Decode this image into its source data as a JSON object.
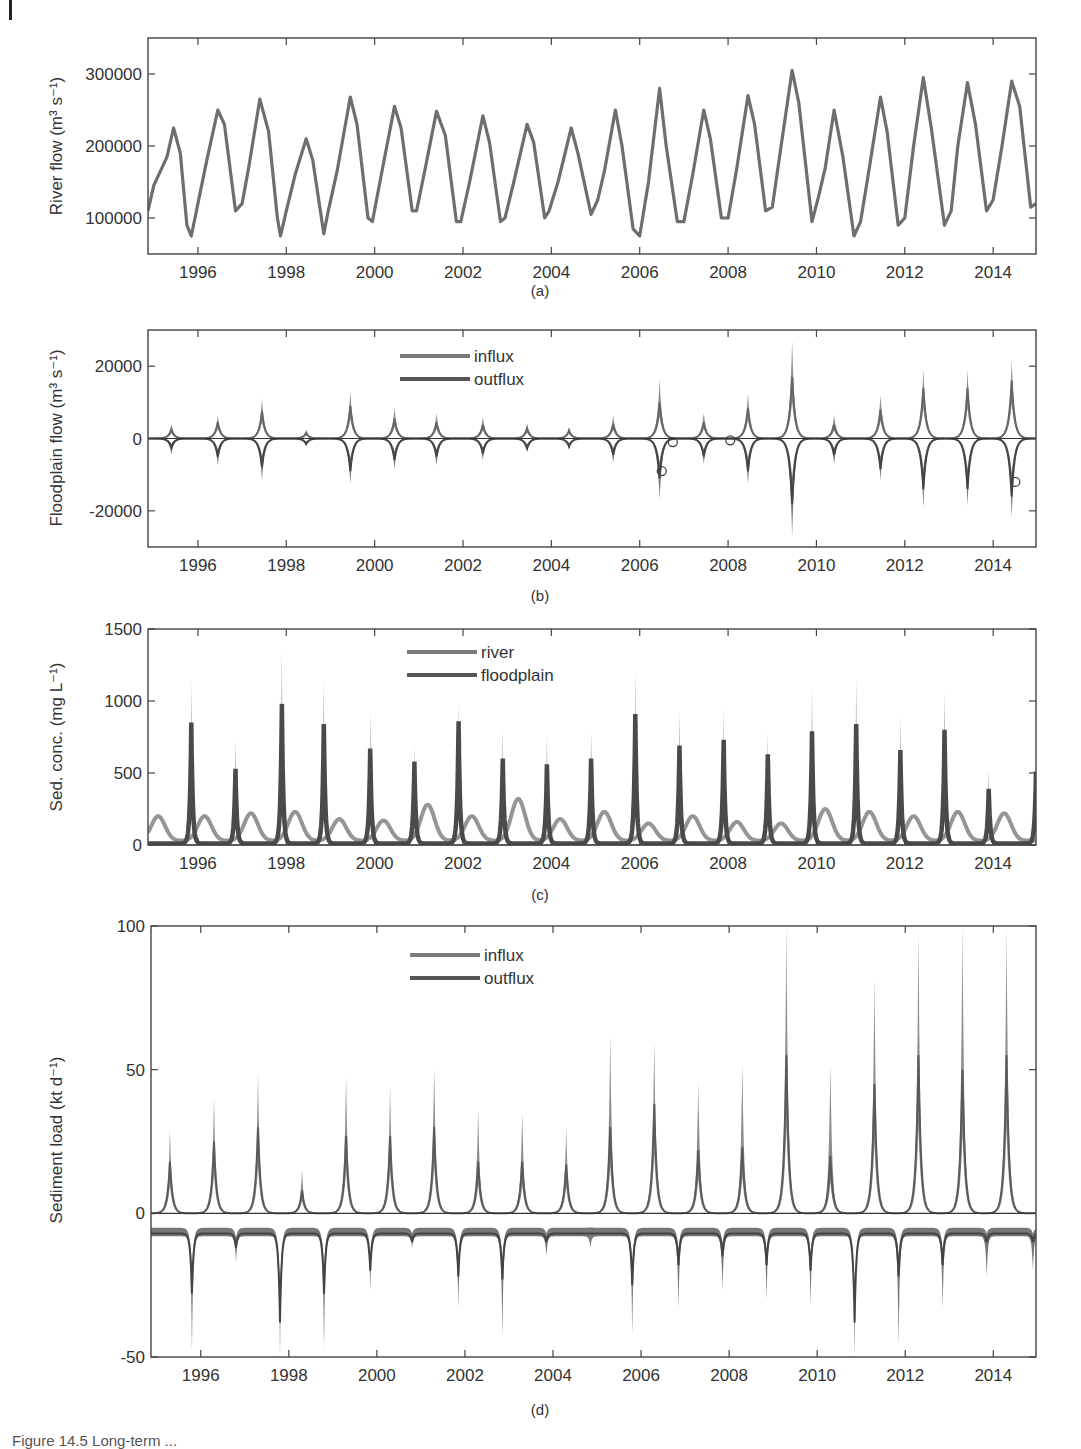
{
  "figure": {
    "caption": "Figure 14.5 Long-term ..."
  },
  "chart_data": [
    {
      "panel": "(a)",
      "type": "line",
      "title": "",
      "xlabel": "",
      "ylabel": "River flow (m³ s⁻¹)",
      "xlim": [
        1994.87,
        2014.97
      ],
      "ylim": [
        50000,
        350000
      ],
      "xticks": [
        1996,
        1998,
        2000,
        2002,
        2004,
        2006,
        2008,
        2010,
        2012,
        2014
      ],
      "yticks": [
        100000,
        200000,
        300000
      ],
      "ytick_labels": [
        "100000",
        "200000",
        "300000"
      ],
      "grid": false,
      "legend": null,
      "series": [
        {
          "name": "river flow",
          "color": "#6e6e6e",
          "x": [
            1994.87,
            1995.0,
            1995.15,
            1995.3,
            1995.45,
            1995.6,
            1995.75,
            1995.85,
            1996.0,
            1996.2,
            1996.45,
            1996.6,
            1996.85,
            1997.0,
            1997.15,
            1997.4,
            1997.6,
            1997.8,
            1997.87,
            1998.0,
            1998.2,
            1998.45,
            1998.6,
            1998.85,
            1998.95,
            1999.15,
            1999.45,
            1999.6,
            1999.85,
            1999.95,
            2000.15,
            2000.45,
            2000.6,
            2000.85,
            2000.95,
            2001.15,
            2001.4,
            2001.6,
            2001.85,
            2001.95,
            2002.15,
            2002.45,
            2002.6,
            2002.85,
            2002.95,
            2003.15,
            2003.45,
            2003.6,
            2003.85,
            2003.95,
            2004.15,
            2004.45,
            2004.6,
            2004.9,
            2005.05,
            2005.2,
            2005.45,
            2005.6,
            2005.85,
            2006.0,
            2006.2,
            2006.45,
            2006.6,
            2006.85,
            2007.0,
            2007.2,
            2007.45,
            2007.6,
            2007.85,
            2008.0,
            2008.2,
            2008.45,
            2008.6,
            2008.85,
            2009.0,
            2009.2,
            2009.45,
            2009.6,
            2009.9,
            2010.05,
            2010.2,
            2010.4,
            2010.6,
            2010.85,
            2011.0,
            2011.2,
            2011.45,
            2011.6,
            2011.85,
            2012.0,
            2012.2,
            2012.42,
            2012.6,
            2012.9,
            2013.05,
            2013.2,
            2013.42,
            2013.6,
            2013.85,
            2014.0,
            2014.2,
            2014.42,
            2014.6,
            2014.85,
            2014.97
          ],
          "y": [
            110000,
            145000,
            165000,
            185000,
            225000,
            190000,
            90000,
            75000,
            120000,
            180000,
            250000,
            230000,
            110000,
            120000,
            170000,
            265000,
            220000,
            100000,
            75000,
            110000,
            160000,
            210000,
            180000,
            78000,
            110000,
            165000,
            268000,
            230000,
            100000,
            95000,
            160000,
            255000,
            225000,
            110000,
            110000,
            170000,
            248000,
            215000,
            95000,
            95000,
            150000,
            242000,
            205000,
            95000,
            100000,
            150000,
            230000,
            205000,
            100000,
            110000,
            150000,
            225000,
            190000,
            105000,
            125000,
            165000,
            250000,
            200000,
            85000,
            75000,
            150000,
            280000,
            200000,
            95000,
            95000,
            160000,
            250000,
            210000,
            100000,
            100000,
            170000,
            270000,
            230000,
            110000,
            115000,
            200000,
            305000,
            260000,
            95000,
            130000,
            170000,
            250000,
            185000,
            75000,
            95000,
            170000,
            268000,
            220000,
            90000,
            100000,
            200000,
            295000,
            225000,
            90000,
            110000,
            200000,
            288000,
            230000,
            110000,
            125000,
            200000,
            290000,
            255000,
            115000,
            120000
          ]
        }
      ]
    },
    {
      "panel": "(b)",
      "type": "area",
      "title": "",
      "xlabel": "",
      "ylabel": "Floodplain flow (m³ s⁻¹)",
      "xlim": [
        1994.87,
        2014.97
      ],
      "ylim": [
        -30000,
        30000
      ],
      "xticks": [
        1996,
        1998,
        2000,
        2002,
        2004,
        2006,
        2008,
        2010,
        2012,
        2014
      ],
      "yticks": [
        -20000,
        0,
        20000
      ],
      "ytick_labels": [
        "-20000",
        "0",
        "20000"
      ],
      "grid": false,
      "zero_line": true,
      "legend": {
        "position": "upper-center",
        "entries": [
          "influx",
          "outflux"
        ]
      },
      "peak_years": [
        1995.4,
        1996.45,
        1997.45,
        1998.45,
        1999.45,
        2000.45,
        2001.4,
        2002.45,
        2003.45,
        2004.4,
        2005.4,
        2006.45,
        2007.45,
        2008.45,
        2009.45,
        2010.4,
        2011.45,
        2012.42,
        2013.42,
        2014.42
      ],
      "series": [
        {
          "name": "influx",
          "color": "#7a7a7a",
          "mean": [
            2500,
            4500,
            7500,
            1500,
            9000,
            5500,
            4500,
            3800,
            2800,
            2200,
            4000,
            10000,
            4500,
            8500,
            17000,
            3800,
            8000,
            14000,
            14000,
            16000
          ],
          "upper": [
            4000,
            6500,
            11000,
            2500,
            13000,
            8500,
            7000,
            6000,
            4200,
            3000,
            6500,
            16500,
            7000,
            12500,
            27000,
            6500,
            12000,
            19000,
            19000,
            22000
          ]
        },
        {
          "name": "outflux",
          "color": "#555555",
          "mean": [
            -2500,
            -5000,
            -8000,
            -1500,
            -9000,
            -6000,
            -5000,
            -4200,
            -2800,
            -2200,
            -4500,
            -11000,
            -5000,
            -9000,
            -18000,
            -4500,
            -8500,
            -14000,
            -14000,
            -16000
          ],
          "lower": [
            -4500,
            -7500,
            -11500,
            -2200,
            -12500,
            -8500,
            -7500,
            -6000,
            -3500,
            -3000,
            -6800,
            -17000,
            -7000,
            -12500,
            -27000,
            -7000,
            -11500,
            -19000,
            -18500,
            -22000
          ]
        }
      ],
      "markers": [
        {
          "x": 2006.5,
          "y": -9000,
          "shape": "circle"
        },
        {
          "x": 2006.75,
          "y": -1000,
          "shape": "circle"
        },
        {
          "x": 2008.05,
          "y": -500,
          "shape": "circle"
        },
        {
          "x": 2014.5,
          "y": -12000,
          "shape": "circle"
        }
      ]
    },
    {
      "panel": "(c)",
      "type": "line",
      "title": "",
      "xlabel": "",
      "ylabel": "Sed. conc. (mg L⁻¹)",
      "xlim": [
        1994.87,
        2014.97
      ],
      "ylim": [
        0,
        1500
      ],
      "xticks": [
        1996,
        1998,
        2000,
        2002,
        2004,
        2006,
        2008,
        2010,
        2012,
        2014
      ],
      "yticks": [
        0,
        500,
        1000,
        1500
      ],
      "ytick_labels": [
        "0",
        "500",
        "1000",
        "1500"
      ],
      "grid": false,
      "legend": {
        "position": "upper-center",
        "entries": [
          "river",
          "floodplain"
        ]
      },
      "series": [
        {
          "name": "river",
          "color": "#8a8a8a",
          "peak_years": [
            1995.1,
            1996.15,
            1997.2,
            1998.2,
            1999.2,
            2000.2,
            2001.2,
            2002.2,
            2003.25,
            2004.2,
            2005.2,
            2006.2,
            2007.2,
            2008.2,
            2009.2,
            2010.2,
            2011.2,
            2012.2,
            2013.2,
            2014.25
          ],
          "peaks": [
            200,
            200,
            220,
            230,
            180,
            170,
            280,
            200,
            320,
            180,
            230,
            150,
            200,
            160,
            150,
            250,
            230,
            200,
            230,
            220
          ]
        },
        {
          "name": "floodplain",
          "color": "#4a4a4a",
          "peak_years": [
            1995.85,
            1996.85,
            1997.9,
            1998.85,
            1999.9,
            2000.9,
            2001.9,
            2002.9,
            2003.9,
            2004.9,
            2005.9,
            2006.9,
            2007.9,
            2008.9,
            2009.9,
            2010.9,
            2011.9,
            2012.9,
            2013.9,
            2014.97
          ],
          "peaks": [
            850,
            530,
            980,
            840,
            670,
            580,
            860,
            600,
            560,
            600,
            910,
            690,
            730,
            630,
            790,
            840,
            660,
            800,
            390,
            510
          ],
          "upper": [
            1140,
            730,
            1350,
            1140,
            920,
            700,
            1000,
            800,
            760,
            790,
            1220,
            930,
            950,
            780,
            1090,
            1160,
            900,
            1070,
            520,
            520
          ]
        }
      ]
    },
    {
      "panel": "(d)",
      "type": "area",
      "title": "",
      "xlabel": "",
      "ylabel": "Sediment load (kt d⁻¹)",
      "xlim": [
        1994.87,
        2014.97
      ],
      "ylim": [
        -50,
        100
      ],
      "xticks": [
        1996,
        1998,
        2000,
        2002,
        2004,
        2006,
        2008,
        2010,
        2012,
        2014
      ],
      "yticks": [
        -50,
        0,
        50,
        100
      ],
      "ytick_labels": [
        "-50",
        "0",
        "50",
        "100"
      ],
      "grid": false,
      "zero_line": true,
      "legend": {
        "position": "upper-center",
        "entries": [
          "influx",
          "outflux"
        ]
      },
      "series": [
        {
          "name": "influx",
          "color": "#7a7a7a",
          "peak_years": [
            1995.3,
            1996.3,
            1997.3,
            1998.3,
            1999.3,
            2000.3,
            2001.3,
            2002.3,
            2003.3,
            2004.3,
            2005.3,
            2006.3,
            2007.3,
            2008.3,
            2009.3,
            2010.3,
            2011.3,
            2012.3,
            2013.3,
            2014.3
          ],
          "mean": [
            18,
            25,
            30,
            8,
            27,
            27,
            30,
            18,
            18,
            17,
            30,
            38,
            22,
            23,
            55,
            20,
            45,
            55,
            50,
            55
          ],
          "upper": [
            29,
            40,
            49,
            15,
            48,
            44,
            51,
            36,
            35,
            30,
            62,
            60,
            46,
            52,
            100,
            52,
            82,
            98,
            100,
            100
          ]
        },
        {
          "name": "outflux",
          "color": "#555555",
          "trough_years": [
            1995.8,
            1996.8,
            1997.8,
            1998.8,
            1999.85,
            2000.8,
            2001.85,
            2002.85,
            2003.85,
            2004.85,
            2005.8,
            2006.85,
            2007.85,
            2008.85,
            2009.85,
            2010.85,
            2011.85,
            2012.85,
            2013.85,
            2014.9
          ],
          "mean": [
            -28,
            -12,
            -38,
            -28,
            -20,
            -10,
            -22,
            -23,
            -10,
            -7,
            -25,
            -18,
            -15,
            -18,
            -20,
            -38,
            -22,
            -18,
            -10,
            -10
          ],
          "lower": [
            -48,
            -17,
            -50,
            -47,
            -27,
            -12,
            -33,
            -43,
            -15,
            -12,
            -42,
            -33,
            -27,
            -30,
            -32,
            -50,
            -46,
            -33,
            -22,
            -20
          ]
        }
      ]
    }
  ]
}
